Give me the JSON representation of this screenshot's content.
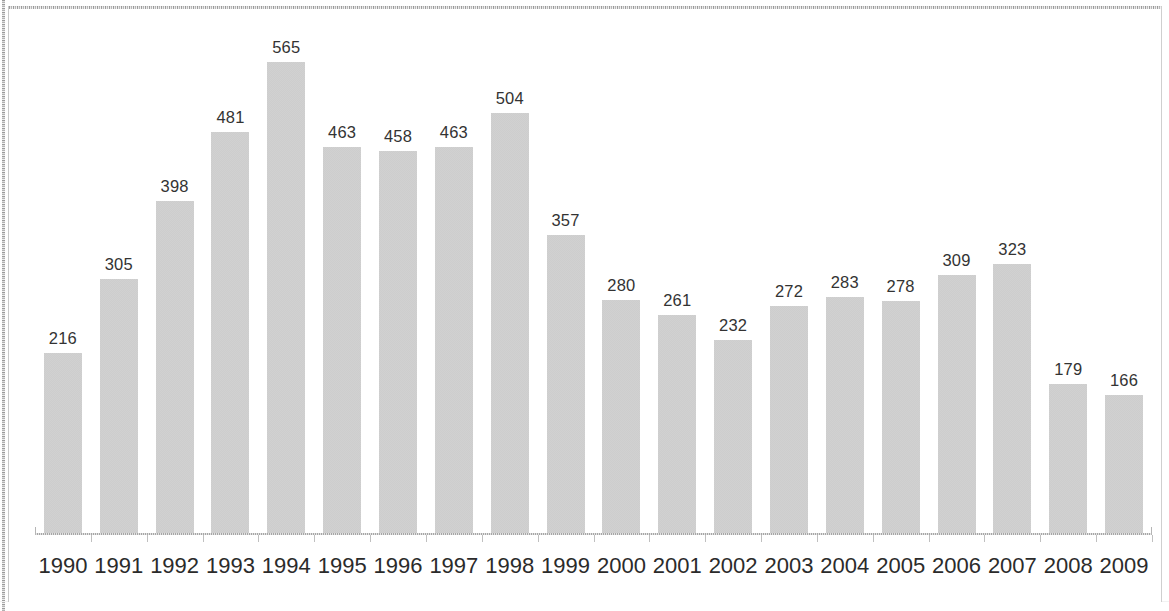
{
  "chart_data": {
    "type": "bar",
    "title": "",
    "subtitle": "",
    "xlabel": "",
    "ylabel": "",
    "ylim": [
      0,
      565
    ],
    "grid": false,
    "legend": null,
    "legend_position": "none",
    "data_labels_shown": true,
    "bar_color": "#9a9a9a",
    "bar_pattern": "checkered-gray-dither",
    "axis_color": "#a6a6a6",
    "label_text_color": "#333333",
    "categories": [
      "1990",
      "1991",
      "1992",
      "1993",
      "1994",
      "1995",
      "1996",
      "1997",
      "1998",
      "1999",
      "2000",
      "2001",
      "2002",
      "2003",
      "2004",
      "2005",
      "2006",
      "2007",
      "2008",
      "2009"
    ],
    "values": [
      216,
      305,
      398,
      481,
      565,
      463,
      458,
      463,
      504,
      357,
      280,
      261,
      232,
      272,
      283,
      278,
      309,
      323,
      179,
      166
    ],
    "value_labels": [
      "216",
      "305",
      "398",
      "481",
      "565",
      "463",
      "458",
      "463",
      "504",
      "357",
      "280",
      "261",
      "232",
      "272",
      "283",
      "278",
      "309",
      "323",
      "179",
      "166"
    ]
  }
}
